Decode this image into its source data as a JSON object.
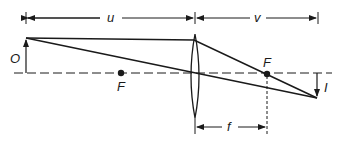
{
  "diagram": {
    "type": "thin-convex-lens-ray-diagram",
    "labels": {
      "object_distance": "u",
      "image_distance": "v",
      "object": "O",
      "image": "I",
      "focal_point_left": "F",
      "focal_point_right": "F",
      "focal_length": "f"
    },
    "colors": {
      "ink": "#1a1a1a",
      "background": "#ffffff"
    }
  }
}
